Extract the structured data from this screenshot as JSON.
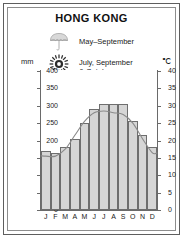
{
  "card": {
    "title": "HONG KONG"
  },
  "legend": [
    {
      "icon": "umbrella-icon",
      "label": "May–September"
    },
    {
      "icon": "sun-icon",
      "label": "July, September\n& October"
    }
  ],
  "legend_rain_label": "May–September",
  "legend_typhoon_line1": "July, September",
  "legend_typhoon_line2": "& October",
  "axes": {
    "left_unit": "mm",
    "right_unit": "℃"
  },
  "chart_data": {
    "type": "bar",
    "title": "HONG KONG",
    "xlabel": "",
    "ylabel": "mm",
    "y2label": "℃",
    "grid": false,
    "legend_position": "top",
    "categories": [
      "J",
      "F",
      "M",
      "A",
      "M",
      "J",
      "J",
      "A",
      "S",
      "O",
      "N",
      "D"
    ],
    "month_names": [
      "January",
      "February",
      "March",
      "April",
      "May",
      "June",
      "July",
      "August",
      "September",
      "October",
      "November",
      "December"
    ],
    "ylim": [
      0,
      400
    ],
    "yticks": [
      0,
      50,
      100,
      150,
      200,
      250,
      300,
      350,
      400
    ],
    "y2lim": [
      0,
      40
    ],
    "y2ticks": [
      0,
      5,
      10,
      15,
      20,
      25,
      30,
      35,
      40
    ],
    "series": [
      {
        "name": "Precipitation",
        "unit": "mm",
        "type": "bar",
        "axis": "left",
        "color": "#d6d6d6",
        "edge_color": "#6e6e6e",
        "values": [
          170,
          165,
          180,
          205,
          250,
          290,
          305,
          305,
          305,
          255,
          215,
          180
        ]
      },
      {
        "name": "Temperature",
        "unit": "℃",
        "type": "line",
        "axis": "right",
        "color": "#8a8a8a",
        "values": [
          15.5,
          15.5,
          17.5,
          21.5,
          25.5,
          28.0,
          28.5,
          28.0,
          27.5,
          25.0,
          20.5,
          16.5
        ]
      }
    ]
  }
}
